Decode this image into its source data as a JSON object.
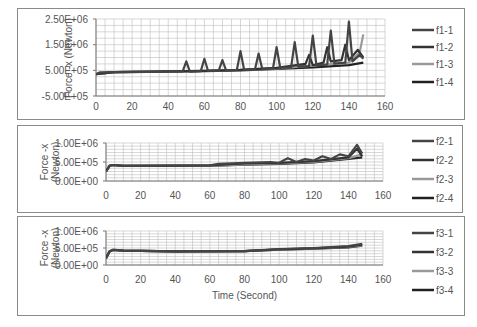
{
  "chart_data": [
    {
      "type": "line",
      "title": "",
      "xlabel": "",
      "ylabel": "Force -x (Newton)",
      "xlim": [
        0,
        160
      ],
      "ylim": [
        -500000,
        2500000
      ],
      "x_ticks": [
        "0",
        "20",
        "40",
        "60",
        "80",
        "100",
        "120",
        "140",
        "160"
      ],
      "y_ticks": [
        "-5.00E+05",
        "5.00E+05",
        "1.50E+06",
        "2.50E+06"
      ],
      "grid": true,
      "legend_position": "right",
      "series": [
        {
          "name": "f1-1",
          "color": "#444444",
          "x": [
            0,
            2,
            10,
            30,
            40,
            48,
            50,
            52,
            58,
            60,
            62,
            68,
            70,
            72,
            78,
            80,
            82,
            88,
            90,
            92,
            98,
            100,
            102,
            108,
            110,
            112,
            118,
            120,
            122,
            128,
            130,
            132,
            138,
            140,
            142,
            146,
            148
          ],
          "values": [
            350000,
            420000,
            430000,
            440000,
            450000,
            460000,
            850000,
            450000,
            470000,
            950000,
            480000,
            500000,
            900000,
            500000,
            520000,
            1250000,
            520000,
            540000,
            1150000,
            560000,
            580000,
            1400000,
            600000,
            620000,
            1600000,
            640000,
            660000,
            1850000,
            700000,
            720000,
            2050000,
            760000,
            800000,
            2400000,
            850000,
            1100000,
            950000
          ]
        },
        {
          "name": "f1-2",
          "color": "#333333",
          "x": [
            0,
            10,
            40,
            60,
            80,
            100,
            116,
            118,
            120,
            126,
            128,
            130,
            136,
            138,
            140,
            145,
            148
          ],
          "values": [
            350000,
            430000,
            460000,
            480000,
            520000,
            600000,
            750000,
            1100000,
            700000,
            800000,
            1400000,
            850000,
            900000,
            1500000,
            900000,
            1300000,
            1000000
          ]
        },
        {
          "name": "f1-3",
          "color": "#999999",
          "x": [
            0,
            10,
            40,
            60,
            80,
            100,
            120,
            140,
            146,
            148
          ],
          "values": [
            350000,
            430000,
            450000,
            480000,
            520000,
            580000,
            680000,
            800000,
            1200000,
            1900000
          ]
        },
        {
          "name": "f1-4",
          "color": "#222222",
          "x": [
            0,
            10,
            40,
            60,
            80,
            100,
            120,
            140,
            148
          ],
          "values": [
            350000,
            430000,
            450000,
            470000,
            500000,
            550000,
            620000,
            700000,
            800000
          ]
        }
      ],
      "legend": [
        "f1-1",
        "f1-2",
        "f1-3",
        "f1-4"
      ]
    },
    {
      "type": "line",
      "title": "",
      "xlabel": "",
      "ylabel": "Force -x (Newton)",
      "xlim": [
        0,
        160
      ],
      "ylim": [
        0,
        1000000
      ],
      "x_ticks": [
        "0",
        "20",
        "40",
        "60",
        "80",
        "100",
        "120",
        "140",
        "160"
      ],
      "y_ticks": [
        "0.00E+00",
        "5.00E+05",
        "1.00E+06"
      ],
      "grid": true,
      "legend_position": "right",
      "series": [
        {
          "name": "f2-1",
          "color": "#444444",
          "x": [
            0,
            2,
            4,
            10,
            30,
            60,
            65,
            80,
            95,
            100,
            105,
            110,
            115,
            120,
            125,
            130,
            135,
            140,
            145,
            148
          ],
          "values": [
            250000,
            400000,
            420000,
            400000,
            400000,
            410000,
            450000,
            480000,
            500000,
            480000,
            600000,
            500000,
            580000,
            540000,
            650000,
            580000,
            700000,
            650000,
            950000,
            720000
          ]
        },
        {
          "name": "f2-2",
          "color": "#333333",
          "x": [
            0,
            2,
            4,
            10,
            60,
            80,
            100,
            120,
            140,
            145,
            148
          ],
          "values": [
            250000,
            400000,
            420000,
            400000,
            410000,
            460000,
            480000,
            520000,
            620000,
            850000,
            650000
          ]
        },
        {
          "name": "f2-3",
          "color": "#999999",
          "x": [
            0,
            2,
            4,
            10,
            60,
            80,
            100,
            120,
            140,
            148
          ],
          "values": [
            250000,
            400000,
            420000,
            400000,
            400000,
            440000,
            460000,
            500000,
            600000,
            700000
          ]
        },
        {
          "name": "f2-4",
          "color": "#222222",
          "x": [
            0,
            2,
            4,
            10,
            60,
            80,
            100,
            120,
            140,
            148
          ],
          "values": [
            250000,
            400000,
            420000,
            400000,
            400000,
            430000,
            450000,
            490000,
            580000,
            620000
          ]
        }
      ],
      "legend": [
        "f2-1",
        "f2-2",
        "f2-3",
        "f2-4"
      ]
    },
    {
      "type": "line",
      "title": "",
      "xlabel": "Time (Second)",
      "ylabel": "Force -x (Newton)",
      "xlim": [
        0,
        160
      ],
      "ylim": [
        0,
        1000000
      ],
      "x_ticks": [
        "0",
        "20",
        "40",
        "60",
        "80",
        "100",
        "120",
        "140",
        "160"
      ],
      "y_ticks": [
        "0.00E+00",
        "5.00E+05",
        "1.00E+06"
      ],
      "grid": true,
      "legend_position": "right",
      "series": [
        {
          "name": "f3-1",
          "color": "#444444",
          "x": [
            0,
            2,
            4,
            10,
            40,
            80,
            100,
            120,
            140,
            148
          ],
          "values": [
            200000,
            400000,
            450000,
            420000,
            400000,
            410000,
            470000,
            500000,
            560000,
            620000
          ]
        },
        {
          "name": "f3-2",
          "color": "#333333",
          "x": [
            0,
            2,
            4,
            10,
            40,
            80,
            100,
            120,
            140,
            148
          ],
          "values": [
            200000,
            400000,
            440000,
            420000,
            400000,
            410000,
            460000,
            490000,
            540000,
            600000
          ]
        },
        {
          "name": "f3-3",
          "color": "#999999",
          "x": [
            0,
            2,
            4,
            10,
            40,
            80,
            100,
            120,
            140,
            148
          ],
          "values": [
            200000,
            400000,
            440000,
            420000,
            400000,
            405000,
            450000,
            480000,
            530000,
            580000
          ]
        },
        {
          "name": "f3-4",
          "color": "#222222",
          "x": [
            0,
            2,
            4,
            10,
            40,
            80,
            100,
            120,
            140,
            148
          ],
          "values": [
            200000,
            400000,
            440000,
            420000,
            400000,
            405000,
            450000,
            480000,
            520000,
            570000
          ]
        }
      ],
      "legend": [
        "f3-1",
        "f3-2",
        "f3-3",
        "f3-4"
      ]
    }
  ],
  "panels": [
    {
      "ylabel_line1": "Force -x (Newton)",
      "ylabel_line2": "",
      "legend": [
        "f1-1",
        "f1-2",
        "f1-3",
        "f1-4"
      ]
    },
    {
      "ylabel_line1": "Force -x",
      "ylabel_line2": "(Newton)",
      "legend": [
        "f2-1",
        "f2-2",
        "f2-3",
        "f2-4"
      ]
    },
    {
      "ylabel_line1": "Force -x",
      "ylabel_line2": "(Newton)",
      "legend": [
        "f3-1",
        "f3-2",
        "f3-3",
        "f3-4"
      ],
      "xlabel": "Time (Second)"
    }
  ]
}
